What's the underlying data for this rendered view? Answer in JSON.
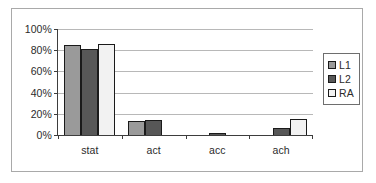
{
  "chart_data": {
    "type": "bar",
    "title": "",
    "xlabel": "",
    "ylabel": "",
    "categories": [
      "stat",
      "act",
      "acc",
      "ach"
    ],
    "series": [
      {
        "name": "L1",
        "color": "#9a9a9a",
        "values": [
          85,
          13,
          0,
          0
        ]
      },
      {
        "name": "L2",
        "color": "#575757",
        "values": [
          81,
          14.5,
          2,
          7
        ]
      },
      {
        "name": "RA",
        "color": "#f2f2f2",
        "values": [
          86,
          0,
          0,
          15
        ]
      }
    ],
    "ylim": [
      0,
      100
    ],
    "ytick_values": [
      0,
      20,
      40,
      60,
      80,
      100
    ],
    "ytick_labels": [
      "0%",
      "20%",
      "40%",
      "60%",
      "80%",
      "100%"
    ],
    "grid": true,
    "grid_axis": "y",
    "legend_position": "right",
    "legend_entries": [
      "L1",
      "L2",
      "RA"
    ],
    "value_suffix": "%"
  }
}
